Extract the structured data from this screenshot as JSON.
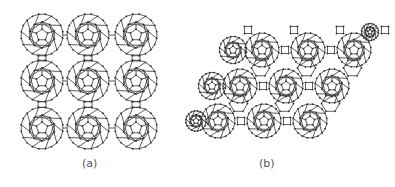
{
  "figure": {
    "panels": [
      {
        "label": "(a)",
        "description": "square lattice of C60 fullerene molecules connected by bonds"
      },
      {
        "label": "(b)",
        "description": "hexagonal (rhombic) lattice of C60 fullerenes with four-membered ring linkages"
      }
    ],
    "colors": {
      "line": "#333333",
      "background": "#ffffff",
      "label": "#555555"
    }
  }
}
